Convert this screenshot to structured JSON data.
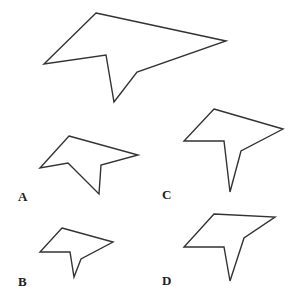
{
  "figure": {
    "stroke_color": "#333333",
    "background": "#ffffff"
  },
  "shapes": {
    "reference": {
      "label": ""
    },
    "options": [
      {
        "id": "A",
        "label": "A"
      },
      {
        "id": "B",
        "label": "B"
      },
      {
        "id": "C",
        "label": "C"
      },
      {
        "id": "D",
        "label": "D"
      }
    ]
  }
}
